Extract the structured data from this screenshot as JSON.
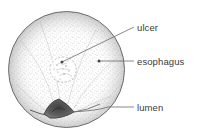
{
  "figure": {
    "type": "medical-illustration",
    "background_color": "#ffffff",
    "ink_color": "#4a4a4a",
    "stipple_color": "#9a9a9a"
  },
  "scope_view": {
    "name": "circular endoscopic field",
    "center_x": 66.5,
    "center_y": 69.5,
    "radius": 58.5,
    "outline_color": "#6d6d6d"
  },
  "labels": [
    {
      "id": "ulcer",
      "text": "ulcer",
      "text_x": 137,
      "text_y": 31,
      "leader": {
        "from_x": 62,
        "from_y": 62,
        "to_x": 134,
        "to_y": 27,
        "marker": "dot"
      }
    },
    {
      "id": "esophagus",
      "text": "esophagus",
      "text_x": 137,
      "text_y": 65,
      "leader": {
        "from_x": 99,
        "from_y": 61,
        "to_x": 134,
        "to_y": 61,
        "marker": "dot"
      }
    },
    {
      "id": "lumen",
      "text": "lumen",
      "text_x": 137,
      "text_y": 111,
      "leader": {
        "from_x": 70,
        "from_y": 112,
        "to_x": 134,
        "to_y": 107,
        "marker": "curve"
      }
    }
  ],
  "features": {
    "ulcer": {
      "name": "ulcer crater",
      "center_x": 62,
      "center_y": 68,
      "radius": 13
    },
    "lumen": {
      "name": "lumen opening",
      "shape": "triangular dark aperture",
      "center_x": 58,
      "center_y": 110,
      "fill_color": "#5d5d5d"
    }
  }
}
